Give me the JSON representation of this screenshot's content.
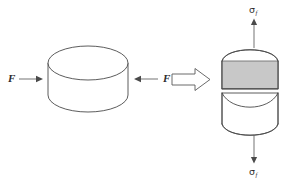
{
  "figure": {
    "kind": "engineering-diagram",
    "background_color": "#ffffff",
    "line_color": "#4a4a4a",
    "shaded_band_color": "#c8c8c8"
  },
  "left_panel": {
    "name": "intact-disc",
    "force_label_left": "F",
    "force_label_right": "F",
    "arrow_left_direction": "right",
    "arrow_right_direction": "left",
    "loading_mode": "compression"
  },
  "transition": {
    "name": "implies-arrow",
    "glyph": "hollow-block-arrow",
    "direction": "right"
  },
  "right_panel": {
    "name": "split-disc",
    "stress_label_top": "σ",
    "stress_subscript_top": "f",
    "stress_label_bottom": "σ",
    "stress_subscript_bottom": "f",
    "arrow_top_direction": "up",
    "arrow_bottom_direction": "down",
    "loading_mode": "tension",
    "shaded_band_label": "tensile-fracture-band"
  },
  "bleed_through_text": "faint reverse-side print showing through the page"
}
